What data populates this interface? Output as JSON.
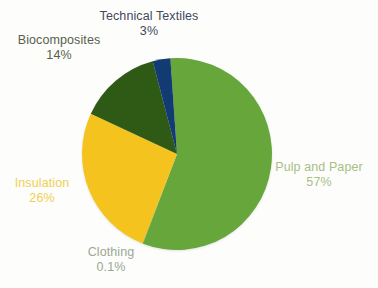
{
  "chart_data": {
    "type": "pie",
    "title": "",
    "subtitle": "",
    "legend_position": "labels-around-slices",
    "grid": false,
    "background_color": "#fdfdfb",
    "total_label": "100%",
    "categories": [
      "Pulp and Paper",
      "Clothing",
      "Insulation",
      "Biocomposites",
      "Technical Textiles"
    ],
    "values": [
      57,
      0.1,
      26,
      14,
      3
    ],
    "value_labels": [
      "57%",
      "0.1%",
      "26%",
      "14%",
      "3%"
    ],
    "colors": [
      "#66a63a",
      "#66a63a",
      "#f5c31e",
      "#2f5a16",
      "#123a73"
    ],
    "start_angle_deg": -4,
    "direction": "clockwise",
    "slices": [
      {
        "name": "Pulp and Paper",
        "value": 57,
        "value_label": "57%",
        "color": "#66a63a",
        "label_color": "#a7bf86"
      },
      {
        "name": "Clothing",
        "value": 0.1,
        "value_label": "0.1%",
        "color": "#66a63a",
        "label_color": "#9aa893"
      },
      {
        "name": "Insulation",
        "value": 26,
        "value_label": "26%",
        "color": "#f5c31e",
        "label_color": "#f0cf55"
      },
      {
        "name": "Biocomposites",
        "value": 14,
        "value_label": "14%",
        "color": "#2f5a16",
        "label_color": "#56604f"
      },
      {
        "name": "Technical Textiles",
        "value": 3,
        "value_label": "3%",
        "color": "#123a73",
        "label_color": "#3f4a5c"
      }
    ]
  },
  "labels": {
    "technical_textiles": {
      "name": "Technical Textiles",
      "pct": "3%"
    },
    "biocomposites": {
      "name": "Biocomposites",
      "pct": "14%"
    },
    "insulation": {
      "name": "Insulation",
      "pct": "26%"
    },
    "clothing": {
      "name": "Clothing",
      "pct": "0.1%"
    },
    "pulp_and_paper": {
      "name": "Pulp and Paper",
      "pct": "57%"
    }
  },
  "artifacts": {
    "bottom_clipped_text": ""
  }
}
